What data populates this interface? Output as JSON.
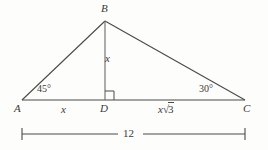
{
  "figure": {
    "type": "geometry-diagram",
    "background_color": "#fdfdfb",
    "stroke_color": "#4a4a4a",
    "text_color": "#3a3a3a",
    "vertices": [
      {
        "name": "B",
        "label": "B",
        "x": 105,
        "y": 21
      },
      {
        "name": "A",
        "label": "A",
        "x": 22,
        "y": 100
      },
      {
        "name": "C",
        "label": "C",
        "x": 245,
        "y": 100
      },
      {
        "name": "D",
        "label": "D",
        "x": 105,
        "y": 100
      }
    ],
    "angles": [
      {
        "at": "A",
        "label": "45°"
      },
      {
        "at": "C",
        "label": "30°"
      },
      {
        "at": "D",
        "label": "right-angle",
        "marker": "square"
      }
    ],
    "segment_labels": [
      {
        "segment": "BD",
        "label": "x"
      },
      {
        "segment": "AD",
        "label": "x"
      },
      {
        "segment": "DC",
        "label_base": "x",
        "label_radical": "√",
        "label_radicand": "3"
      }
    ],
    "dimension": {
      "segment": "AC",
      "label": "12",
      "tick_style": "serif-ends"
    }
  }
}
